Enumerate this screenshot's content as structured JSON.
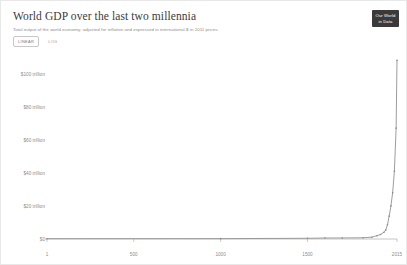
{
  "header": {
    "title": "World GDP over the last two millennia",
    "subtitle": "Total output of the world economy; adjusted for inflation and expressed in international-$ in 2011 prices.",
    "logo_line1": "Our World",
    "logo_line2": "in Data"
  },
  "controls": {
    "linear_label": "LINEAR",
    "log_label": "LOG",
    "selected": "LINEAR"
  },
  "colors": {
    "line": "#8b8b8b",
    "axis": "#adadad",
    "text": "#8b8b8b",
    "title": "#3b3b3b",
    "logo_bg": "#3a3a3a"
  },
  "chart_data": {
    "type": "line",
    "title": "World GDP over the last two millennia",
    "subtitle": "Total output of the world economy; adjusted for inflation and expressed in international-$ in 2011 prices.",
    "xlabel": "",
    "ylabel": "",
    "xlim": [
      1,
      2015
    ],
    "ylim": [
      0,
      110
    ],
    "y_unit": "trillion international-$ (2011 prices)",
    "grid": false,
    "legend": false,
    "y_ticks": [
      0,
      20,
      40,
      60,
      80,
      100
    ],
    "y_tick_labels": [
      "$0",
      "$20 trillion",
      "$40 trillion",
      "$60 trillion",
      "$80 trillion",
      "$100 trillion"
    ],
    "x_ticks": [
      1,
      500,
      1000,
      1500,
      2015
    ],
    "x_tick_labels": [
      "1",
      "500",
      "1000",
      "1500",
      "2015"
    ],
    "series": [
      {
        "name": "World GDP",
        "x": [
          1,
          1000,
          1500,
          1600,
          1700,
          1820,
          1870,
          1900,
          1920,
          1940,
          1950,
          1960,
          1970,
          1980,
          1990,
          2000,
          2010,
          2015
        ],
        "values": [
          0.18,
          0.21,
          0.43,
          0.58,
          0.64,
          0.74,
          1.1,
          1.98,
          2.73,
          4.06,
          5.34,
          8.59,
          13.8,
          20.0,
          28.0,
          41.0,
          67.0,
          108.0
        ]
      }
    ]
  }
}
